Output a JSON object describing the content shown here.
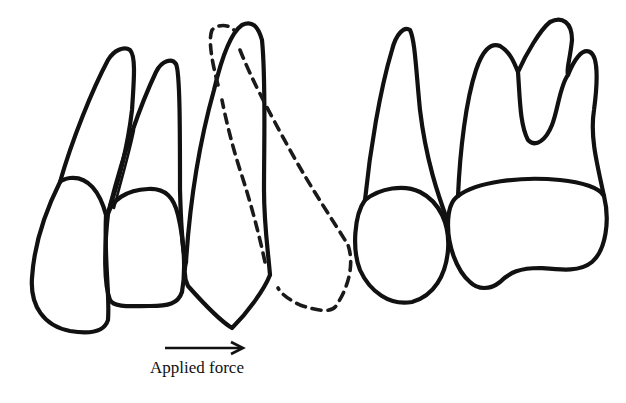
{
  "diagram": {
    "type": "dental-diagram",
    "teeth": [
      {
        "name": "central-incisor",
        "style": "solid"
      },
      {
        "name": "lateral-incisor",
        "style": "solid"
      },
      {
        "name": "canine",
        "style": "solid"
      },
      {
        "name": "canine-displaced",
        "style": "dashed"
      },
      {
        "name": "first-premolar",
        "style": "solid"
      },
      {
        "name": "first-molar",
        "style": "solid"
      }
    ],
    "arrow": {
      "direction": "right",
      "meaning": "applied force"
    },
    "label": "Applied force"
  },
  "colors": {
    "line": "#111111",
    "background": "#ffffff"
  }
}
